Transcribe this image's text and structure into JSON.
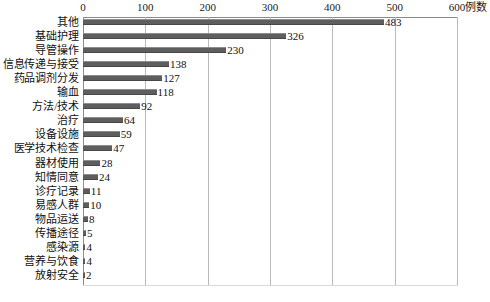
{
  "chart_data": {
    "type": "bar",
    "orientation": "horizontal",
    "title": "",
    "subtitle": "",
    "xlabel": "例数",
    "ylabel": "",
    "xlim": [
      0,
      600
    ],
    "xticks": [
      0,
      100,
      200,
      300,
      400,
      500,
      600
    ],
    "xtick_labels": [
      "0",
      "100",
      "200",
      "300",
      "400",
      "500",
      "600"
    ],
    "grid": true,
    "legend": null,
    "bar_color": "#5e5e5e",
    "gridline_color": "#b9b9b9",
    "categories": [
      "其他",
      "基础护理",
      "导管操作",
      "信息传递与接受",
      "药品调剂分发",
      "输血",
      "方法/技术",
      "治疗",
      "设备设施",
      "医学技术检查",
      "器材使用",
      "知情同意",
      "诊疗记录",
      "易感人群",
      "物品运送",
      "传播途径",
      "感染源",
      "营养与饮食",
      "放射安全"
    ],
    "values": [
      483,
      326,
      230,
      138,
      127,
      118,
      92,
      64,
      59,
      47,
      28,
      24,
      11,
      10,
      8,
      5,
      4,
      4,
      2
    ],
    "value_labels": [
      "483",
      "326",
      "230",
      "138",
      "127",
      "118",
      "92",
      "64",
      "59",
      "47",
      "28",
      "24",
      "11",
      "10",
      "8",
      "5",
      "4",
      "4",
      "2"
    ]
  }
}
